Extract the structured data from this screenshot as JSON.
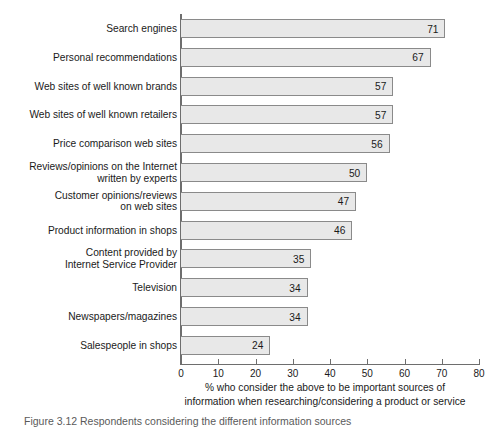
{
  "chart_data": {
    "type": "bar",
    "orientation": "horizontal",
    "title": "",
    "subtitle": "",
    "xlabel": "% who consider the above to be important sources of\ninformation when researching/considering a product or service",
    "ylabel": "",
    "xlim": [
      0,
      80
    ],
    "xticks": [
      0,
      10,
      20,
      30,
      40,
      50,
      60,
      70,
      80
    ],
    "xtick_labels": [
      "0",
      "10",
      "20",
      "30",
      "40",
      "50",
      "60",
      "70",
      "80"
    ],
    "grid": false,
    "legend": false,
    "show_value_labels": true,
    "bar_fill_color": "#e8e8e8",
    "bar_border_color": "#8a8a8a",
    "axis_color": "#6e6e6e",
    "categories": [
      "Search engines",
      "Personal recommendations",
      "Web sites of well known brands",
      "Web sites of well known retailers",
      "Price comparison web sites",
      "Reviews/opinions on the Internet\nwritten by experts",
      "Customer opinions/reviews\non web sites",
      "Product information in shops",
      "Content provided by\nInternet Service Provider",
      "Television",
      "Newspapers/magazines",
      "Salespeople in shops"
    ],
    "values": [
      71,
      67,
      57,
      57,
      56,
      50,
      47,
      46,
      35,
      34,
      34,
      24
    ],
    "value_labels": [
      "71",
      "67",
      "57",
      "57",
      "56",
      "50",
      "47",
      "46",
      "35",
      "34",
      "34",
      "24"
    ]
  },
  "axis_title": {
    "line1": "% who consider the above to be important sources of",
    "line2": "information when researching/considering a product or service"
  },
  "caption": {
    "text": "Figure  3.12  Respondents considering the different information sources"
  }
}
